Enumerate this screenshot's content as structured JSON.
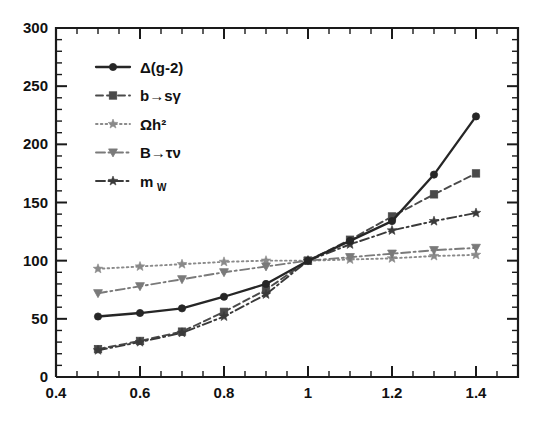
{
  "chart_data": {
    "type": "line",
    "title": "",
    "subtitle": "",
    "xlabel": "",
    "ylabel": "",
    "xlim": [
      0.4,
      1.5
    ],
    "ylim": [
      0,
      300
    ],
    "grid": false,
    "legend_position": "upper-left",
    "x": [
      0.5,
      0.6,
      0.7,
      0.8,
      0.9,
      1.0,
      1.1,
      1.2,
      1.3,
      1.4
    ],
    "xticks": [
      0.4,
      0.6,
      0.8,
      1.0,
      1.2,
      1.4
    ],
    "xticklabels": [
      "0.4",
      "0.6",
      "0.8",
      "1",
      "1.2",
      "1.4"
    ],
    "xtick_minor_step": 0.05,
    "yticks": [
      0,
      50,
      100,
      150,
      200,
      250,
      300
    ],
    "yticklabels": [
      "0",
      "50",
      "100",
      "150",
      "200",
      "250",
      "300"
    ],
    "ytick_minor_step": 10,
    "series": [
      {
        "name": "delta-g-2",
        "label": "Δ(g-2)",
        "marker": "circle",
        "linestyle": "solid",
        "color": "#262626",
        "values": [
          52,
          55,
          59,
          69,
          80,
          100,
          117,
          134,
          174,
          224
        ]
      },
      {
        "name": "b-to-s-gamma",
        "label": "b→sγ",
        "marker": "square",
        "linestyle": "dashed",
        "color": "#4a4a4a",
        "values": [
          24,
          31,
          39,
          56,
          75,
          100,
          118,
          138,
          157,
          175
        ]
      },
      {
        "name": "omega-h-squared",
        "label": "Ωh²",
        "marker": "star",
        "linestyle": "dotted",
        "color": "#8a8a8a",
        "values": [
          93,
          95,
          97,
          99,
          100,
          100,
          101,
          102,
          104,
          105
        ]
      },
      {
        "name": "b-to-tau-nu",
        "label": "B→τν",
        "marker": "triangle-down",
        "linestyle": "dashdot",
        "color": "#7a7a7a",
        "values": [
          72,
          78,
          84,
          90,
          95,
          100,
          103,
          106,
          109,
          111
        ]
      },
      {
        "name": "m-w",
        "label": "m_W",
        "marker": "star",
        "linestyle": "dashdot",
        "color": "#3a3a3a",
        "values": [
          23,
          30,
          38,
          52,
          71,
          100,
          114,
          126,
          134,
          141
        ]
      }
    ]
  },
  "legend": {
    "entries": [
      {
        "label_main": "Δ(g-2)",
        "label_sub": ""
      },
      {
        "label_main": "b→sγ",
        "label_sub": ""
      },
      {
        "label_main": "Ωh²",
        "label_sub": ""
      },
      {
        "label_main": "B→τν",
        "label_sub": ""
      },
      {
        "label_main": "m",
        "label_sub": "W"
      }
    ]
  },
  "axes": {
    "y_labels": [
      "300",
      "250",
      "200",
      "150",
      "100",
      "50",
      "0"
    ],
    "x_labels": [
      "0.4",
      "0.6",
      "0.8",
      "1",
      "1.2",
      "1.4"
    ]
  },
  "colors": {
    "frame": "#1a1a1a",
    "text": "#111111",
    "background": "#ffffff"
  }
}
